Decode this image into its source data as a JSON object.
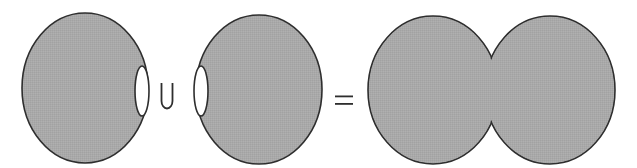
{
  "diagram": {
    "colors": {
      "background": "#ffffff",
      "shape_fill": "#a9a9a9",
      "outline": "#2e2e2e",
      "hole_fill": "#ffffff"
    },
    "operands": [
      {
        "name": "left-blob",
        "ellipse": {
          "cx": 85,
          "cy": 88,
          "rx": 63,
          "ry": 75
        },
        "hole": {
          "cx": 142,
          "cy": 91,
          "rx": 7,
          "ry": 25,
          "side": "right"
        }
      },
      {
        "name": "right-blob",
        "ellipse": {
          "cx": 259,
          "cy": 89.5,
          "rx": 63,
          "ry": 74.5
        },
        "hole": {
          "cx": 201,
          "cy": 91,
          "rx": 7,
          "ry": 25,
          "side": "left"
        }
      }
    ],
    "operators": {
      "union": "∪",
      "equals": "="
    },
    "result": {
      "name": "merged-blob",
      "lobes": [
        {
          "cx": 433,
          "cy": 90,
          "rx": 65,
          "ry": 74
        },
        {
          "cx": 550,
          "cy": 90,
          "rx": 65,
          "ry": 74
        }
      ],
      "pinch_x": 491
    }
  }
}
